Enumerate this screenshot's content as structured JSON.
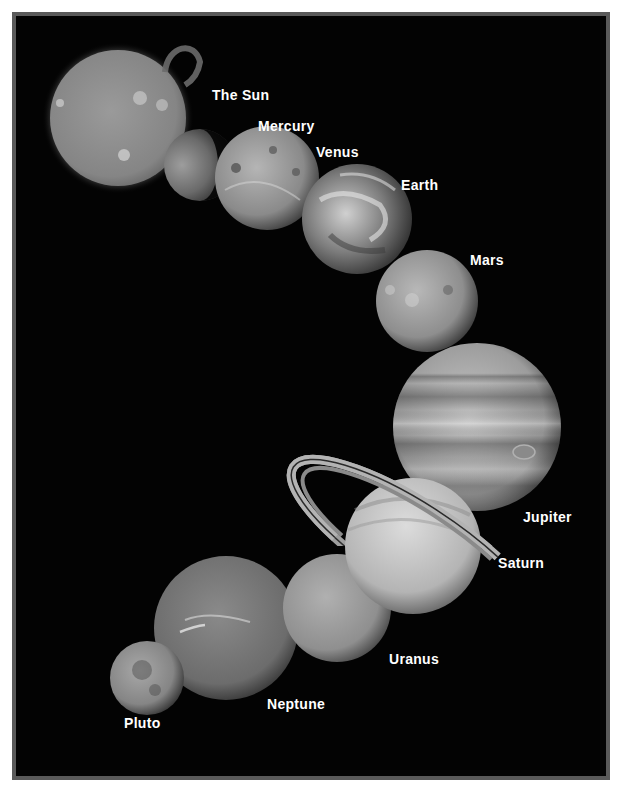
{
  "poster": {
    "background_color": "#030303",
    "frame_color": "#5a5a5a",
    "page_color": "#ffffff"
  },
  "bodies": [
    {
      "id": "sun",
      "label": "The Sun",
      "cx": 118,
      "cy": 118,
      "r": 68,
      "label_x": 212,
      "label_y": 88
    },
    {
      "id": "mercury",
      "label": "Mercury",
      "cx": 200,
      "cy": 165,
      "r": 36,
      "label_x": 258,
      "label_y": 119
    },
    {
      "id": "venus",
      "label": "Venus",
      "cx": 267,
      "cy": 178,
      "r": 52,
      "label_x": 316,
      "label_y": 145
    },
    {
      "id": "earth",
      "label": "Earth",
      "cx": 357,
      "cy": 219,
      "r": 55,
      "label_x": 401,
      "label_y": 178
    },
    {
      "id": "mars",
      "label": "Mars",
      "cx": 427,
      "cy": 301,
      "r": 51,
      "label_x": 470,
      "label_y": 253
    },
    {
      "id": "jupiter",
      "label": "Jupiter",
      "cx": 477,
      "cy": 427,
      "r": 84,
      "label_x": 523,
      "label_y": 510
    },
    {
      "id": "saturn",
      "label": "Saturn",
      "cx": 413,
      "cy": 546,
      "r": 68,
      "label_x": 498,
      "label_y": 556
    },
    {
      "id": "uranus",
      "label": "Uranus",
      "cx": 337,
      "cy": 608,
      "r": 54,
      "label_x": 389,
      "label_y": 652
    },
    {
      "id": "neptune",
      "label": "Neptune",
      "cx": 226,
      "cy": 628,
      "r": 72,
      "label_x": 267,
      "label_y": 697
    },
    {
      "id": "pluto",
      "label": "Pluto",
      "cx": 147,
      "cy": 678,
      "r": 37,
      "label_x": 124,
      "label_y": 716
    }
  ]
}
